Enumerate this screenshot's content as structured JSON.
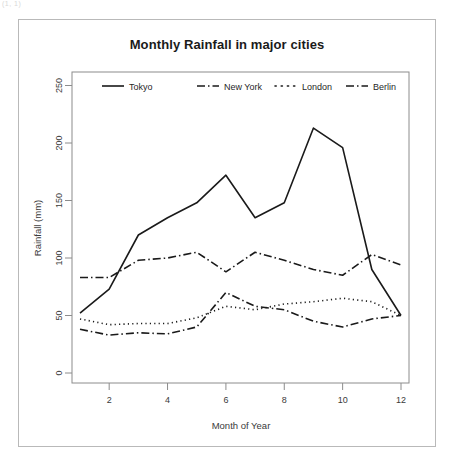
{
  "artifact_text": "(1, 1)",
  "figure": {
    "title": "Monthly Rainfall in major cities",
    "xlabel": "Month of Year",
    "ylabel": "Rainfall (mm)"
  },
  "axes": {
    "y_ticks": [
      "0",
      "50",
      "100",
      "150",
      "200",
      "250"
    ],
    "x_ticks": [
      "2",
      "4",
      "6",
      "8",
      "10",
      "12"
    ]
  },
  "legend": {
    "entries": [
      {
        "label": "Tokyo",
        "style": "solid"
      },
      {
        "label": "New York",
        "style": "dashdot"
      },
      {
        "label": "London",
        "style": "dotted"
      },
      {
        "label": "Berlin",
        "style": "dashdot"
      }
    ]
  },
  "colors": {
    "line": "#1a1a1a",
    "frame": "#8c8c8c",
    "outer_frame": "#b9b9b9",
    "text": "#1a1a1a",
    "background": "#ffffff"
  },
  "chart_data": {
    "type": "line",
    "title": "Monthly Rainfall in major cities",
    "xlabel": "Month of Year",
    "ylabel": "Rainfall (mm)",
    "x": [
      1,
      2,
      3,
      4,
      5,
      6,
      7,
      8,
      9,
      10,
      11,
      12
    ],
    "xlim": [
      1,
      12
    ],
    "ylim": [
      0,
      260
    ],
    "grid": false,
    "legend_position": "top-inside",
    "series": [
      {
        "name": "Tokyo",
        "style": "solid",
        "values": [
          52,
          73,
          120,
          135,
          148,
          172,
          135,
          148,
          213,
          196,
          90,
          50
        ]
      },
      {
        "name": "New York",
        "style": "dashdot",
        "values": [
          83,
          83,
          98,
          100,
          105,
          88,
          105,
          98,
          90,
          85,
          103,
          94
        ]
      },
      {
        "name": "London",
        "style": "dotted",
        "values": [
          47,
          42,
          43,
          43,
          48,
          58,
          55,
          60,
          62,
          65,
          62,
          50
        ]
      },
      {
        "name": "Berlin",
        "style": "dashdot",
        "values": [
          38,
          33,
          35,
          34,
          40,
          70,
          58,
          55,
          45,
          40,
          47,
          50
        ]
      }
    ]
  }
}
